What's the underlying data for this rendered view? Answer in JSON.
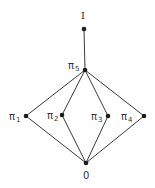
{
  "diagram": {
    "type": "hasse-lattice",
    "nodes": [
      {
        "id": "I",
        "label": "I",
        "sub": "",
        "x": 84,
        "y": 29
      },
      {
        "id": "pi5",
        "label": "π",
        "sub": "5",
        "x": 85,
        "y": 70
      },
      {
        "id": "pi1",
        "label": "π",
        "sub": "1",
        "x": 26,
        "y": 116
      },
      {
        "id": "pi2",
        "label": "π",
        "sub": "2",
        "x": 62,
        "y": 115
      },
      {
        "id": "pi3",
        "label": "π",
        "sub": "3",
        "x": 108,
        "y": 116
      },
      {
        "id": "pi4",
        "label": "π",
        "sub": "4",
        "x": 144,
        "y": 116
      },
      {
        "id": "zero",
        "label": "0",
        "sub": "",
        "x": 86,
        "y": 163
      }
    ],
    "edges": [
      [
        "I",
        "pi5"
      ],
      [
        "pi5",
        "pi1"
      ],
      [
        "pi5",
        "pi2"
      ],
      [
        "pi5",
        "pi3"
      ],
      [
        "pi5",
        "pi4"
      ],
      [
        "pi1",
        "zero"
      ],
      [
        "pi2",
        "zero"
      ],
      [
        "pi3",
        "zero"
      ],
      [
        "pi4",
        "zero"
      ]
    ],
    "labels": {
      "top": "I",
      "pi5": "π",
      "pi5_sub": "5",
      "pi1": "π",
      "pi1_sub": "1",
      "pi2": "π",
      "pi2_sub": "2",
      "pi3": "π",
      "pi3_sub": "3",
      "pi4": "π",
      "pi4_sub": "4",
      "bottom": "0"
    }
  }
}
